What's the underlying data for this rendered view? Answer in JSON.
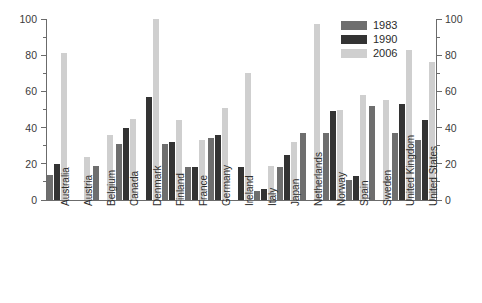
{
  "chart_data": {
    "type": "bar",
    "title": "",
    "subtitle": "",
    "xlabel": "",
    "ylabel": "",
    "ylim": [
      0,
      100
    ],
    "yticks": [
      0,
      20,
      40,
      60,
      80,
      100
    ],
    "yticklabels": [
      "0",
      "20",
      "40",
      "60",
      "80",
      "100"
    ],
    "yminorticks": [
      10,
      30,
      50,
      70,
      90
    ],
    "grid": false,
    "legend_position": "top-right",
    "dual_y_axis": true,
    "categories": [
      "Australia",
      "Austria",
      "Belgium",
      "Canada",
      "Denmark",
      "Finland",
      "France",
      "Germany",
      "Ireland",
      "Italy",
      "Japan",
      "Netherlands",
      "Norway",
      "Spain",
      "Sweden",
      "United Kingdom",
      "United States"
    ],
    "series": [
      {
        "name": "1983",
        "color": "#6e6e6e",
        "values": [
          14,
          null,
          19,
          31,
          null,
          31,
          18,
          34,
          null,
          5,
          18,
          37,
          37,
          11,
          52,
          37,
          33
        ]
      },
      {
        "name": "1990",
        "color": "#333333",
        "values": [
          20,
          null,
          null,
          40,
          57,
          32,
          18,
          36,
          18,
          6,
          25,
          null,
          49,
          13,
          null,
          53,
          44
        ]
      },
      {
        "name": "2006",
        "color": "#cfcfcf",
        "values": [
          81,
          24,
          36,
          45,
          100,
          44,
          33,
          51,
          70,
          19,
          32,
          97,
          50,
          58,
          55,
          83,
          76
        ]
      }
    ]
  },
  "legend": {
    "entries": [
      {
        "label": "1983",
        "swatch": "s1983"
      },
      {
        "label": "1990",
        "swatch": "s1990"
      },
      {
        "label": "2006",
        "swatch": "s2006"
      }
    ]
  },
  "axes": {
    "left_tick_labels": [
      "0",
      "20",
      "40",
      "60",
      "80",
      "100"
    ],
    "right_tick_labels": [
      "0",
      "20",
      "40",
      "60",
      "80",
      "100"
    ]
  }
}
